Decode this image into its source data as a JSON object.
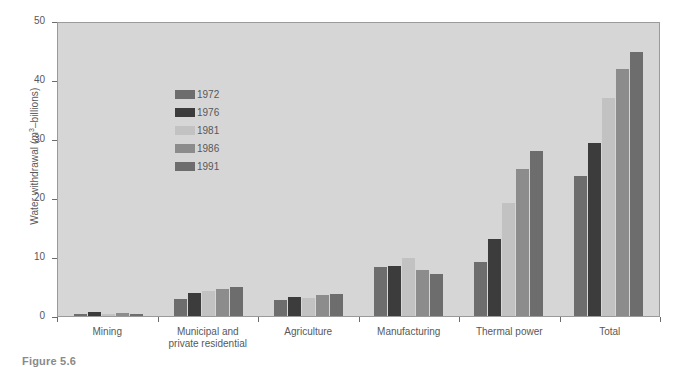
{
  "figure": {
    "caption": "Figure 5.6"
  },
  "chart_data": {
    "type": "bar",
    "title": "",
    "xlabel": "",
    "ylabel": "Water withdrawal (m3–billions)",
    "ylabel_parts": {
      "pre": "Water withdrawal (m",
      "sup": "3",
      "post": "–billions)"
    },
    "ylim": [
      0,
      50
    ],
    "yticks": [
      0,
      10,
      20,
      30,
      40,
      50
    ],
    "ytick_labels": [
      "0",
      "10",
      "20",
      "30",
      "40",
      "50"
    ],
    "grid": false,
    "legend_position": "upper-left-inside",
    "plot_background": "#d6d6d6",
    "categories": [
      "Mining",
      "Municipal and private residential",
      "Agriculture",
      "Manufacturing",
      "Thermal power",
      "Total"
    ],
    "category_labels": [
      {
        "line1": "Mining",
        "line2": ""
      },
      {
        "line1": "Municipal and",
        "line2": "private residential"
      },
      {
        "line1": "Agriculture",
        "line2": ""
      },
      {
        "line1": "Manufacturing",
        "line2": ""
      },
      {
        "line1": "Thermal power",
        "line2": ""
      },
      {
        "line1": "Total",
        "line2": ""
      }
    ],
    "series": [
      {
        "name": "1972",
        "color": "#6d6d6d",
        "values": [
          0.4,
          2.9,
          2.7,
          8.3,
          9.2,
          23.7
        ]
      },
      {
        "name": "1976",
        "color": "#3c3c3c",
        "values": [
          0.7,
          3.9,
          3.2,
          8.5,
          13.0,
          29.3
        ]
      },
      {
        "name": "1981",
        "color": "#c2c2c2",
        "values": [
          0.4,
          4.2,
          3.0,
          9.9,
          19.1,
          37.0
        ]
      },
      {
        "name": "1986",
        "color": "#8c8c8c",
        "values": [
          0.5,
          4.6,
          3.5,
          7.8,
          25.0,
          41.8
        ]
      },
      {
        "name": "1991",
        "color": "#6d6d6d",
        "values": [
          0.3,
          4.9,
          3.8,
          7.1,
          28.0,
          44.7
        ]
      }
    ]
  }
}
